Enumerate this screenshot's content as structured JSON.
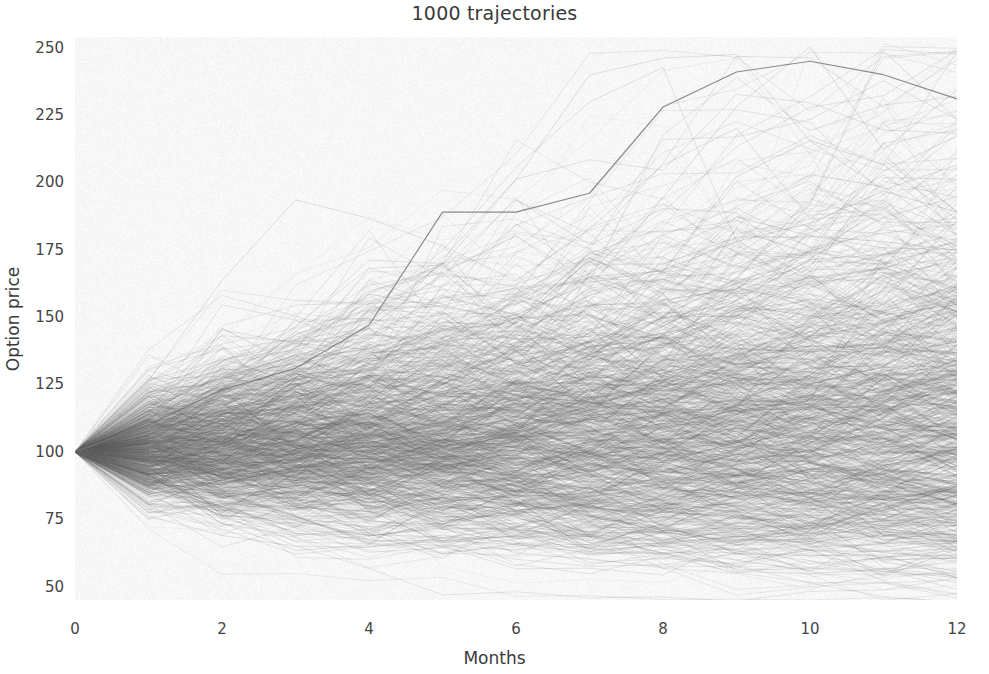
{
  "chart_data": {
    "type": "line",
    "title": "1000 trajectories",
    "xlabel": "Months",
    "ylabel": "Option price",
    "n_trajectories": 1000,
    "x": [
      0,
      1,
      2,
      3,
      4,
      5,
      6,
      7,
      8,
      9,
      10,
      11,
      12
    ],
    "xticks": [
      0,
      2,
      4,
      6,
      8,
      10,
      12
    ],
    "xticklabels": [
      "0",
      "2",
      "4",
      "6",
      "8",
      "10",
      "12"
    ],
    "yticks": [
      50,
      75,
      100,
      125,
      150,
      175,
      200,
      225,
      250
    ],
    "yticklabels": [
      "50",
      "75",
      "100",
      "125",
      "150",
      "175",
      "200",
      "225",
      "250"
    ],
    "xlim": [
      0,
      12
    ],
    "ylim": [
      45,
      254
    ],
    "grid": false,
    "legend": null,
    "start_value": 100,
    "series_style": {
      "color": "#6b6b6b",
      "alpha": 0.12,
      "linewidth": 1.0,
      "interpolation": "linear",
      "kinks_at_integer_months": true
    },
    "envelope": {
      "note": "approximate min/max of the bundle at each month",
      "max": [
        100,
        128,
        141,
        148,
        163,
        189,
        189,
        196,
        196,
        215,
        245,
        240,
        231
      ],
      "min": [
        100,
        88,
        80,
        75,
        70,
        66,
        63,
        59,
        56,
        54,
        52,
        50,
        48
      ],
      "median": [
        100,
        101,
        102,
        103,
        105,
        106,
        108,
        110,
        112,
        114,
        116,
        118,
        120
      ]
    },
    "named_outliers": [
      {
        "label": "top path",
        "values": [
          100,
          110,
          123,
          131,
          147,
          189,
          189,
          196,
          228,
          241,
          245,
          240,
          231
        ]
      }
    ],
    "colors": {
      "figure_background": "#ffffff",
      "axes_background": "#f7f7f7",
      "line": "#6b6b6b",
      "text": "#3a3a3a",
      "tick_text": "#444444"
    }
  }
}
